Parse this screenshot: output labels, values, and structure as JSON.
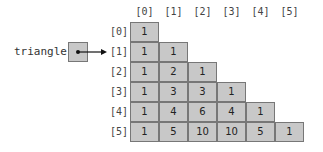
{
  "variable": {
    "name": "triangle"
  },
  "column_headers": [
    "[0]",
    "[1]",
    "[2]",
    "[3]",
    "[4]",
    "[5]"
  ],
  "row_headers": [
    "[0]",
    "[1]",
    "[2]",
    "[3]",
    "[4]",
    "[5]"
  ],
  "rows": [
    [
      "1"
    ],
    [
      "1",
      "1"
    ],
    [
      "1",
      "2",
      "1"
    ],
    [
      "1",
      "3",
      "3",
      "1"
    ],
    [
      "1",
      "4",
      "6",
      "4",
      "1"
    ],
    [
      "1",
      "5",
      "10",
      "10",
      "5",
      "1"
    ]
  ],
  "colors": {
    "cell_fill": "#c8c8c8",
    "cell_border": "#777777",
    "arrow": "#111111"
  }
}
